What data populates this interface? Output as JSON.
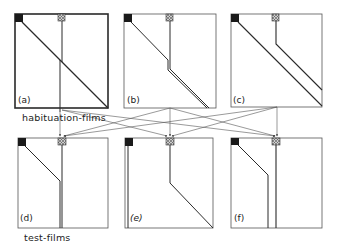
{
  "figure": {
    "type": "schematic film diagram",
    "colors": {
      "line": "#2a2a2a",
      "frame": "#555555",
      "background": "#ffffff",
      "marker_dark": "#1a1a1a",
      "marker_grey": "#999999"
    }
  },
  "row_labels": {
    "habituation": "habituation-films",
    "test": "test-films"
  },
  "panels": [
    {
      "id": "a",
      "label": "(a)",
      "row": "habituation"
    },
    {
      "id": "b",
      "label": "(b)",
      "row": "habituation"
    },
    {
      "id": "c",
      "label": "(c)",
      "row": "habituation"
    },
    {
      "id": "d",
      "label": "(d)",
      "row": "test"
    },
    {
      "id": "e",
      "label": "(e)",
      "row": "test"
    },
    {
      "id": "f",
      "label": "(f)",
      "row": "test"
    }
  ],
  "icons": {
    "start_marker": "black-square",
    "object_marker": "grey-patterned-square"
  }
}
